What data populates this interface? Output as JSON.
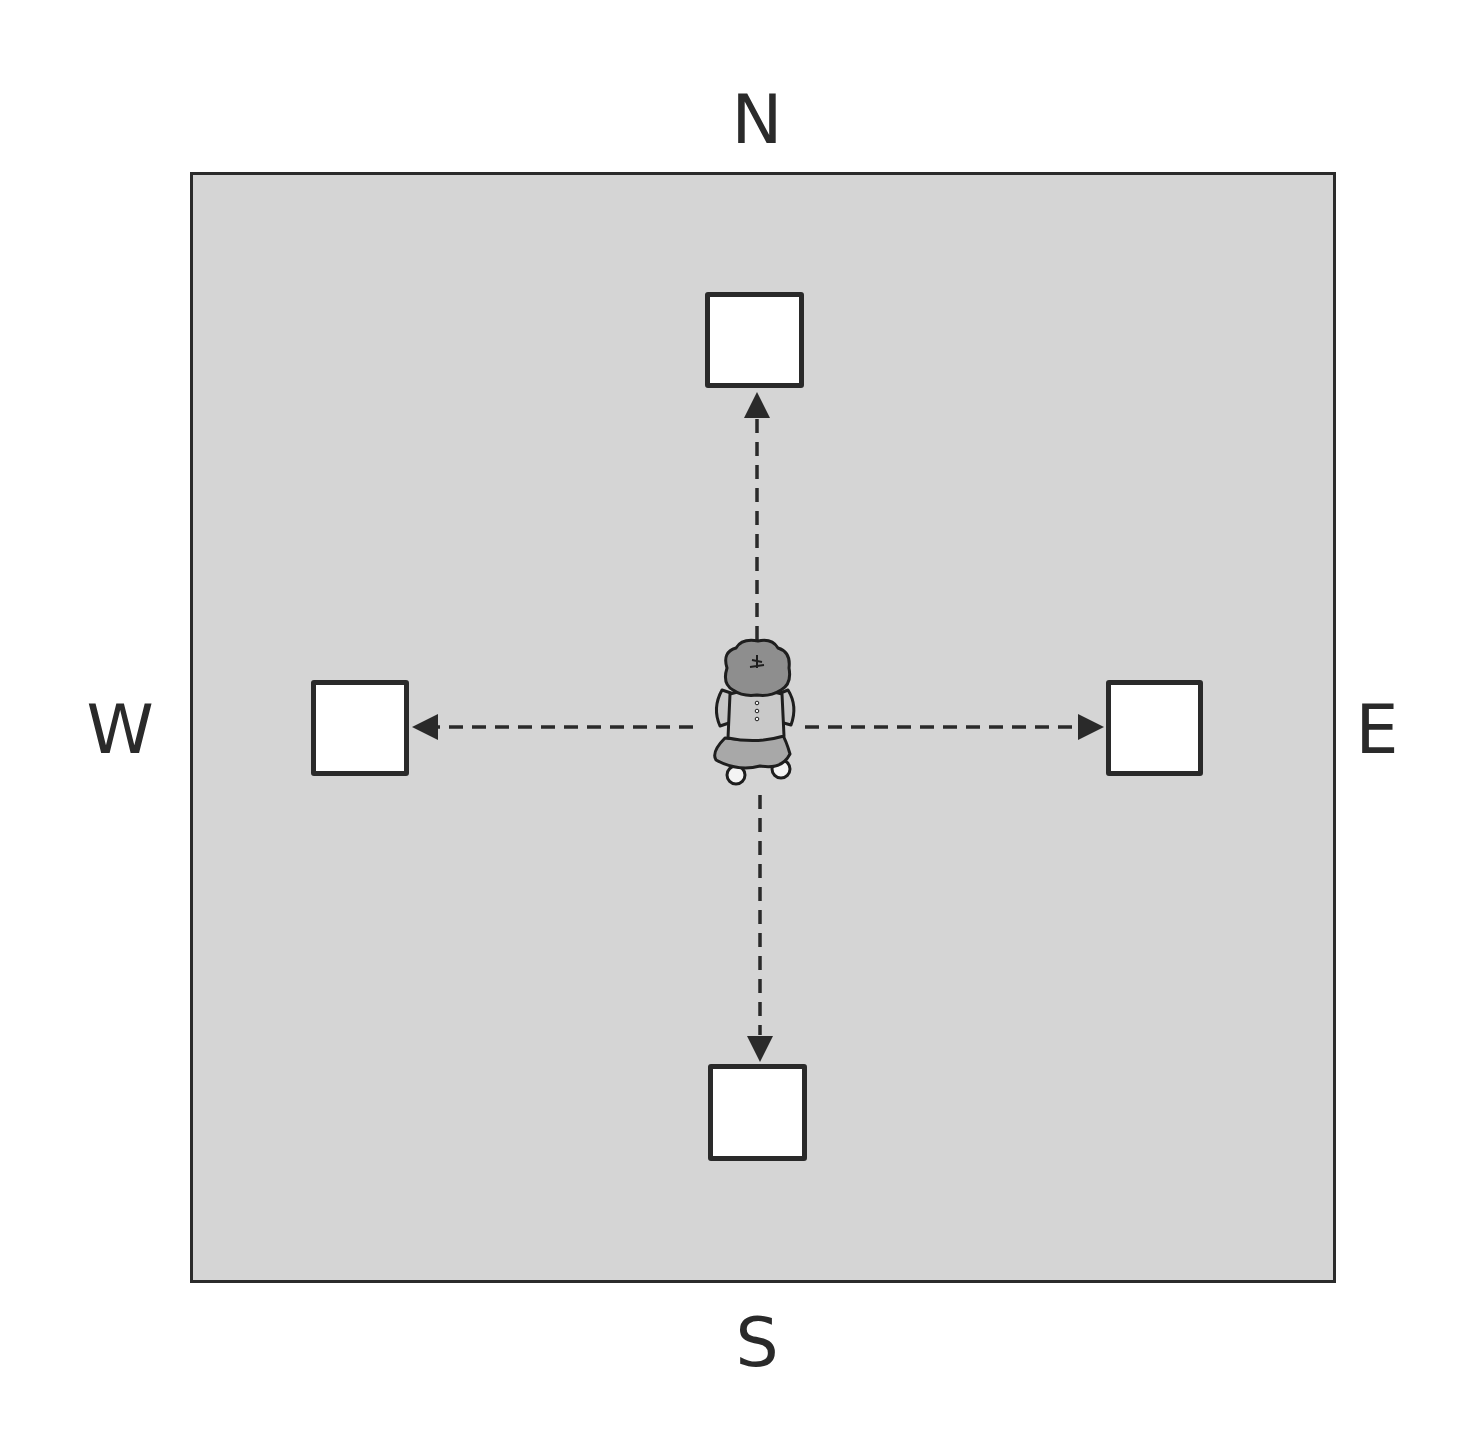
{
  "diagram": {
    "type": "compass-direction-diagram",
    "compass_labels": {
      "north": "N",
      "south": "S",
      "west": "W",
      "east": "E"
    },
    "field": {
      "fill_color": "#d5d5d5",
      "border_color": "#2b2b2b"
    },
    "center_figure": {
      "icon": "child-top-view-icon",
      "description": "Child seen from above standing at the center"
    },
    "targets": [
      {
        "id": "north-box",
        "direction": "north"
      },
      {
        "id": "east-box",
        "direction": "east"
      },
      {
        "id": "south-box",
        "direction": "south"
      },
      {
        "id": "west-box",
        "direction": "west"
      }
    ],
    "arrows": {
      "style": "dashed",
      "color": "#2a2a2a",
      "directions": [
        "north",
        "east",
        "south",
        "west"
      ]
    }
  }
}
